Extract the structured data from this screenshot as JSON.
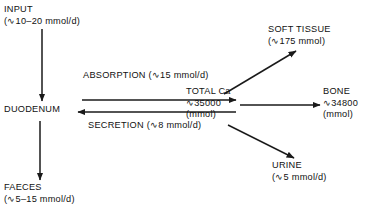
{
  "diagram": {
    "colors": {
      "text": "#111111",
      "stroke": "#1a1a1a",
      "background": "#ffffff"
    },
    "nodes": {
      "input": {
        "label": "INPUT",
        "value": "(∿10–20 mmol/d)"
      },
      "duodenum": {
        "label": "DUODENUM"
      },
      "faeces": {
        "label": "FAECES",
        "value": "(∿5–15 mmol/d)"
      },
      "total_ca": {
        "label": "TOTAL Ca",
        "value": "∿35000",
        "unit": "(mmol)"
      },
      "soft_tissue": {
        "label": "SOFT TISSUE",
        "value": "(∿175 mmol)"
      },
      "bone": {
        "label": "BONE",
        "value": "∿34800",
        "unit": "(mmol)"
      },
      "urine": {
        "label": "URINE",
        "value": "(∿5 mmol/d)"
      }
    },
    "edges": {
      "absorption": {
        "label": "ABSORPTION",
        "value": "(∿15 mmol/d)"
      },
      "secretion": {
        "label": "SECRETION",
        "value": "(∿8 mmol/d)"
      }
    }
  }
}
